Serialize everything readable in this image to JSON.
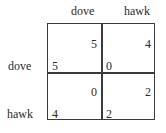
{
  "game": {
    "columns": [
      "dove",
      "hawk"
    ],
    "rows": [
      "dove",
      "hawk"
    ],
    "cells": [
      [
        {
          "row_payoff": "5",
          "col_payoff": "5"
        },
        {
          "row_payoff": "0",
          "col_payoff": "4"
        }
      ],
      [
        {
          "row_payoff": "4",
          "col_payoff": "0"
        },
        {
          "row_payoff": "2",
          "col_payoff": "2"
        }
      ]
    ]
  }
}
